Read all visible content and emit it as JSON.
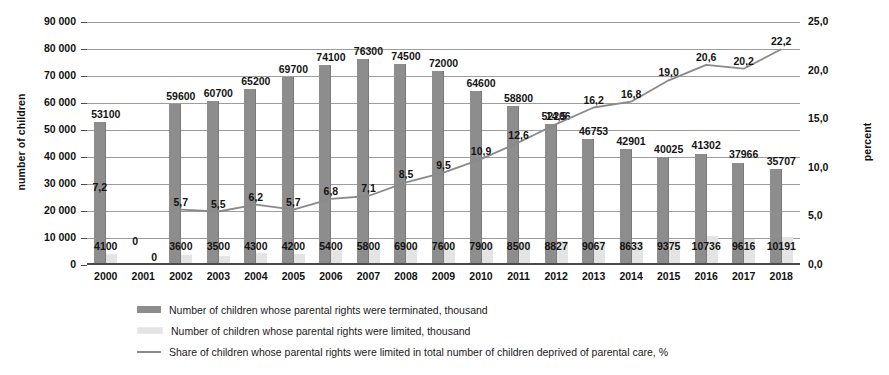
{
  "chart_data": {
    "type": "bar",
    "title": "",
    "xlabel": "",
    "ylabel": "number of children",
    "y2label": "percent",
    "ylim": [
      0,
      90000
    ],
    "y2lim": [
      0.0,
      25.0
    ],
    "grid": true,
    "legend_position": "bottom",
    "categories": [
      "2000",
      "2001",
      "2002",
      "2003",
      "2004",
      "2005",
      "2006",
      "2007",
      "2008",
      "2009",
      "2010",
      "2011",
      "2012",
      "2013",
      "2014",
      "2015",
      "2016",
      "2017",
      "2018"
    ],
    "y_ticks": [
      "0",
      "10 000",
      "20 000",
      "30 000",
      "40 000",
      "50 000",
      "60 000",
      "70 000",
      "80 000",
      "90 000"
    ],
    "y2_ticks": [
      "0,0",
      "5,0",
      "10,0",
      "15,0",
      "20,0",
      "25,0"
    ],
    "series": [
      {
        "name": "Number of children whose parental rights were terminated, thousand",
        "type": "bar",
        "axis": "left",
        "color": "#8d8d8d",
        "values": [
          53100,
          null,
          59600,
          60700,
          65200,
          69700,
          74100,
          76300,
          74500,
          72000,
          64600,
          58800,
          52206,
          46753,
          42901,
          40025,
          41302,
          37966,
          35707
        ],
        "labels": [
          "53100",
          "0",
          "59600",
          "60700",
          "65200",
          "69700",
          "74100",
          "76300",
          "74500",
          "72000",
          "64600",
          "58800",
          "52206",
          "46753",
          "42901",
          "40025",
          "41302",
          "37966",
          "35707"
        ]
      },
      {
        "name": "Number of children whose parental rights were limited, thousand",
        "type": "bar",
        "axis": "left",
        "color": "#e4e4e4",
        "values": [
          4100,
          null,
          3600,
          3500,
          4300,
          4200,
          5400,
          5800,
          6900,
          7600,
          7900,
          8500,
          8827,
          9067,
          8633,
          9375,
          10736,
          9616,
          10191
        ],
        "labels": [
          "4100",
          "0",
          "3600",
          "3500",
          "4300",
          "4200",
          "5400",
          "5800",
          "6900",
          "7600",
          "7900",
          "8500",
          "8827",
          "9067",
          "8633",
          "9375",
          "10736",
          "9616",
          "10191"
        ]
      },
      {
        "name": "Share of children whose parental rights were limited in total number of children deprived of parental care, %",
        "type": "line",
        "axis": "right",
        "color": "#8a8a8a",
        "values": [
          7.2,
          null,
          5.7,
          5.5,
          6.2,
          5.7,
          6.8,
          7.1,
          8.5,
          9.5,
          10.9,
          12.6,
          14.5,
          16.2,
          16.8,
          19.0,
          20.6,
          20.2,
          22.2
        ],
        "labels": [
          "7,2",
          "",
          "5,7",
          "5,5",
          "6,2",
          "5,7",
          "6,8",
          "7,1",
          "8,5",
          "9,5",
          "10,9",
          "12,6",
          "14,5",
          "16,2",
          "16,8",
          "19,0",
          "20,6",
          "20,2",
          "22,2"
        ]
      }
    ]
  }
}
